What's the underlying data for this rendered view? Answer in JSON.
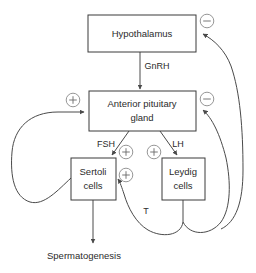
{
  "diagram": {
    "type": "flow-diagram",
    "colors": {
      "background": "#ffffff",
      "box_stroke": "#3a3a3a",
      "line_stroke": "#4a4a4a",
      "sign_stroke": "#8a8a8a",
      "text": "#2b2b2b"
    },
    "nodes": [
      {
        "id": "hypothalamus",
        "label": "Hypothalamus",
        "lines": [
          "Hypothalamus"
        ],
        "shape": "rect"
      },
      {
        "id": "anterior-pituitary",
        "label": "Anterior pituitary gland",
        "lines": [
          "Anterior pituitary",
          "gland"
        ],
        "shape": "rect"
      },
      {
        "id": "sertoli-cells",
        "label": "Sertoli cells",
        "lines": [
          "Sertoli",
          "cells"
        ],
        "shape": "rect"
      },
      {
        "id": "leydig-cells",
        "label": "Leydig cells",
        "lines": [
          "Leydig",
          "cells"
        ],
        "shape": "rect"
      }
    ],
    "outcome": {
      "id": "spermatogenesis",
      "label": "Spermatogenesis"
    },
    "edge_labels": [
      {
        "id": "gnrh",
        "label": "GnRH",
        "from": "hypothalamus",
        "to": "anterior-pituitary"
      },
      {
        "id": "fsh",
        "label": "FSH",
        "from": "anterior-pituitary",
        "to": "sertoli-cells"
      },
      {
        "id": "lh",
        "label": "LH",
        "from": "anterior-pituitary",
        "to": "leydig-cells"
      },
      {
        "id": "testosterone",
        "label": "T",
        "from": "leydig-cells",
        "to": "sertoli-cells"
      }
    ],
    "signs": [
      {
        "id": "sign-inhibin-hypothalamus",
        "symbol": "−",
        "name": "minus",
        "target": "hypothalamus"
      },
      {
        "id": "sign-inhibin-pituitary-left",
        "symbol": "+",
        "name": "plus",
        "target": "anterior-pituitary"
      },
      {
        "id": "sign-testosterone-pituitary",
        "symbol": "−",
        "name": "minus",
        "target": "anterior-pituitary"
      },
      {
        "id": "sign-fsh-sertoli",
        "symbol": "+",
        "name": "plus",
        "target": "sertoli-cells"
      },
      {
        "id": "sign-lh-leydig",
        "symbol": "+",
        "name": "plus",
        "target": "leydig-cells"
      },
      {
        "id": "sign-testosterone-sertoli",
        "symbol": "+",
        "name": "plus",
        "target": "sertoli-cells"
      }
    ]
  }
}
